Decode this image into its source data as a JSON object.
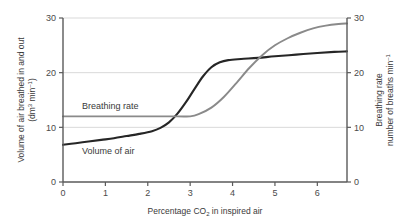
{
  "chart_data": {
    "type": "line",
    "title": "",
    "xlabel": "Percentage CO2 in inspired air",
    "xlabel_main": "Percentage CO",
    "xlabel_sub": "2",
    "xlabel_tail": " in inspired air",
    "ylabel_left_line1": "Volume of air breathed in and out",
    "ylabel_left_line2_main": "(dm",
    "ylabel_left_line2_sup": "3",
    "ylabel_left_line2_mid": " min",
    "ylabel_left_line2_sup2": "–1",
    "ylabel_left_line2_tail": ")",
    "ylabel_left": "Volume of air breathed in and out (dm3 min-1)",
    "ylabel_right_line1": "Breathing rate",
    "ylabel_right_line2_main": "number of breaths min",
    "ylabel_right_line2_sup": "–1",
    "ylabel_right": "Breathing rate number of breaths min-1",
    "xlim": [
      0,
      6.7
    ],
    "ylim": [
      0,
      30
    ],
    "ylim_right": [
      0,
      30
    ],
    "xticks": [
      0,
      1,
      2,
      3,
      4,
      5,
      6
    ],
    "xtick_labels": [
      "0",
      "1",
      "2",
      "3",
      "4",
      "5",
      "6"
    ],
    "yticks": [
      0,
      10,
      20,
      30
    ],
    "ytick_labels": [
      "0",
      "10",
      "20",
      "30"
    ],
    "yticks_right": [
      0,
      10,
      20,
      30
    ],
    "ytick_labels_right": [
      "0",
      "10",
      "20",
      "30"
    ],
    "grid": true,
    "gridlines_y": [
      10,
      20,
      30
    ],
    "legend_position": "inline-annotations",
    "colors": {
      "volume_of_air": "#262626",
      "breathing_rate": "#8a8a8a",
      "axis": "#5a5a5a",
      "grid": "#d9d9d9",
      "background": "#ffffff"
    },
    "series": [
      {
        "name": "Volume of air",
        "color": "#262626",
        "axis": "left",
        "label_x": 0.45,
        "label_y": 5.1,
        "points": [
          [
            0.0,
            6.8
          ],
          [
            0.3,
            7.1
          ],
          [
            0.6,
            7.4
          ],
          [
            0.9,
            7.7
          ],
          [
            1.2,
            8.0
          ],
          [
            1.5,
            8.4
          ],
          [
            1.8,
            8.8
          ],
          [
            2.1,
            9.3
          ],
          [
            2.3,
            9.9
          ],
          [
            2.5,
            10.9
          ],
          [
            2.7,
            12.5
          ],
          [
            2.9,
            14.6
          ],
          [
            3.1,
            17.0
          ],
          [
            3.3,
            19.3
          ],
          [
            3.5,
            21.0
          ],
          [
            3.7,
            21.9
          ],
          [
            3.9,
            22.3
          ],
          [
            4.2,
            22.5
          ],
          [
            4.6,
            22.7
          ],
          [
            5.0,
            23.0
          ],
          [
            5.5,
            23.3
          ],
          [
            6.0,
            23.6
          ],
          [
            6.4,
            23.8
          ],
          [
            6.7,
            23.9
          ]
        ]
      },
      {
        "name": "Breathing rate",
        "color": "#8a8a8a",
        "axis": "right",
        "label_x": 0.45,
        "label_y": 13.4,
        "points": [
          [
            0.0,
            12.0
          ],
          [
            1.0,
            12.0
          ],
          [
            2.0,
            12.0
          ],
          [
            2.7,
            12.0
          ],
          [
            3.0,
            12.0
          ],
          [
            3.2,
            12.4
          ],
          [
            3.5,
            13.6
          ],
          [
            3.8,
            15.6
          ],
          [
            4.1,
            18.2
          ],
          [
            4.4,
            20.9
          ],
          [
            4.7,
            23.2
          ],
          [
            5.0,
            25.0
          ],
          [
            5.3,
            26.3
          ],
          [
            5.6,
            27.3
          ],
          [
            5.9,
            28.1
          ],
          [
            6.2,
            28.6
          ],
          [
            6.5,
            28.9
          ],
          [
            6.7,
            29.0
          ]
        ]
      }
    ],
    "annotations": [
      {
        "text": "Breathing rate",
        "series": "Breathing rate"
      },
      {
        "text": "Volume of air",
        "series": "Volume of air"
      }
    ]
  }
}
